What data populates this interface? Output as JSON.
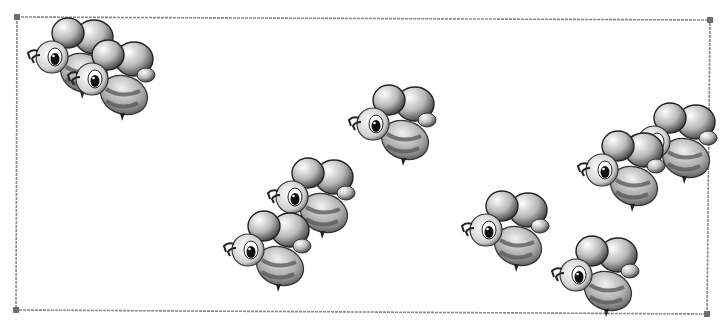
{
  "scene": {
    "description": "Picture of bees inside a rectangular frame",
    "bee_count": 9,
    "frame": {
      "corners": [
        [
          17,
          17
        ],
        [
          710,
          20
        ],
        [
          707,
          314
        ],
        [
          16,
          310
        ]
      ],
      "stroke": "#8a8a8a",
      "handle_color": "#6e6e6e"
    },
    "bees": [
      {
        "x": 22,
        "y": 15,
        "scale": 1.0
      },
      {
        "x": 62,
        "y": 37,
        "scale": 1.0
      },
      {
        "x": 343,
        "y": 82,
        "scale": 1.0
      },
      {
        "x": 262,
        "y": 155,
        "scale": 1.0
      },
      {
        "x": 218,
        "y": 208,
        "scale": 1.0
      },
      {
        "x": 624,
        "y": 100,
        "scale": 1.0
      },
      {
        "x": 572,
        "y": 128,
        "scale": 1.0
      },
      {
        "x": 456,
        "y": 188,
        "scale": 1.0
      },
      {
        "x": 546,
        "y": 233,
        "scale": 1.0
      }
    ]
  }
}
